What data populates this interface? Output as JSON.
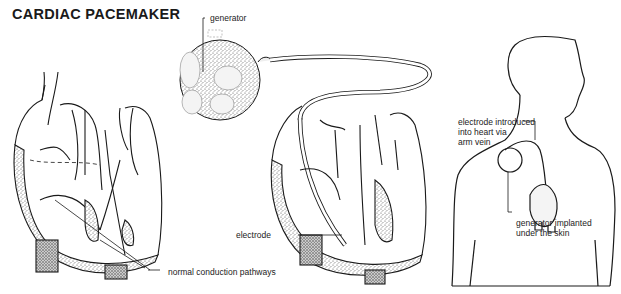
{
  "title": "CARDIAC PACEMAKER",
  "labels": {
    "generator": "generator",
    "electrode_arm_vein": "electrode introduced\ninto heart via\narm vein",
    "generator_implanted": "generator implanted\nunder the skin",
    "electrode": "electrode",
    "conduction": "normal conduction pathways"
  },
  "figures": [
    {
      "name": "normal heart cross-section"
    },
    {
      "name": "pacemaker generator"
    },
    {
      "name": "heart with pacemaker electrode"
    },
    {
      "name": "human torso with implanted pacemaker"
    }
  ],
  "colors": {
    "ink": "#1a1a1a",
    "stipple": "#8a8a8a",
    "background": "#ffffff"
  }
}
